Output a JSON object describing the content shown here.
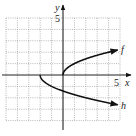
{
  "chart_data": {
    "type": "line",
    "title": "",
    "xlabel": "x",
    "ylabel": "y",
    "xlim": [
      -5,
      5
    ],
    "ylim": [
      -4,
      5
    ],
    "grid": true,
    "x_tick_labels": [
      {
        "value": 5,
        "label": "5"
      }
    ],
    "y_tick_labels": [
      {
        "value": 5,
        "label": "5"
      }
    ],
    "series": [
      {
        "name": "f",
        "description": "f(x) = sqrt(x)",
        "x": [
          0,
          0.25,
          1,
          2,
          3,
          4,
          4.8
        ],
        "y": [
          0,
          0.5,
          1,
          1.41,
          1.73,
          2,
          2.19
        ],
        "arrow_end": true
      },
      {
        "name": "h",
        "description": "h(x) = -sqrt(x + 2)",
        "x": [
          -2,
          -1.75,
          -1,
          0,
          1,
          2,
          3,
          4,
          4.8
        ],
        "y": [
          0,
          -0.5,
          -1,
          -1.41,
          -1.73,
          -2,
          -2.24,
          -2.45,
          -2.61
        ],
        "arrow_end": true
      }
    ],
    "annotations": [
      {
        "text": "f",
        "near": "end of f curve"
      },
      {
        "text": "h",
        "near": "end of h curve"
      }
    ]
  },
  "labels": {
    "x_axis": "x",
    "y_axis": "y",
    "x_tick": "5",
    "y_tick": "5",
    "f": "f",
    "h": "h"
  }
}
